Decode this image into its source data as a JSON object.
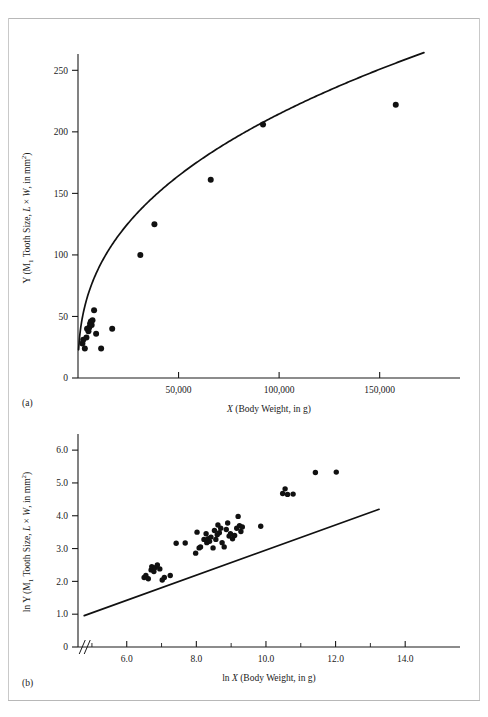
{
  "figure": {
    "panels": [
      {
        "id": "a",
        "caption": "(a)"
      },
      {
        "id": "b",
        "caption": "(b)"
      }
    ]
  },
  "chart_data": [
    {
      "type": "scatter",
      "panel": "a",
      "title": "",
      "xlabel": "X (Body Weight, in g)",
      "ylabel": "Y (M₁ Tooth Size, L × W, in mm²)",
      "ylabel_parts": {
        "prefix": "Y (M",
        "sub": "1",
        "mid": " Tooth Size, ",
        "italic_l": "L",
        "times": " × ",
        "italic_w": "W",
        "suffix": ", in mm",
        "sup": "2",
        "close": ")"
      },
      "xlabel_parts": {
        "italic_x": "X",
        "rest": " (Body Weight, in g)"
      },
      "xlim": [
        0,
        180000
      ],
      "ylim": [
        0,
        260
      ],
      "xticks": [
        0,
        50000,
        100000,
        150000
      ],
      "xticklabels": [
        "",
        "50,000",
        "100,000",
        "150,000"
      ],
      "yticks": [
        0,
        50,
        100,
        150,
        200,
        250
      ],
      "yticklabels": [
        "0",
        "50",
        "100",
        "150",
        "200",
        "250"
      ],
      "grid": false,
      "legend": "none",
      "points": [
        [
          2200,
          28
        ],
        [
          2600,
          31
        ],
        [
          3400,
          24
        ],
        [
          4200,
          33
        ],
        [
          4500,
          40
        ],
        [
          5200,
          38
        ],
        [
          5600,
          41
        ],
        [
          6000,
          44
        ],
        [
          6400,
          46
        ],
        [
          6800,
          43
        ],
        [
          7200,
          47
        ],
        [
          8000,
          55
        ],
        [
          9000,
          36
        ],
        [
          11500,
          24
        ],
        [
          17000,
          40
        ],
        [
          31000,
          100
        ],
        [
          38000,
          125
        ],
        [
          66000,
          161
        ],
        [
          92000,
          206
        ],
        [
          158000,
          222
        ]
      ],
      "fit": {
        "kind": "power",
        "label": "",
        "coefficient": 2.55,
        "exponent": 0.385,
        "x_start": 300,
        "x_end": 172000
      }
    },
    {
      "type": "scatter",
      "panel": "b",
      "title": "",
      "xlabel": "ln X (Body Weight, in g)",
      "ylabel": "ln Y (M₁ Tooth Size, L × W, in mm²)",
      "ylabel_parts": {
        "prefix": "ln Y (M",
        "sub": "1",
        "mid": " Tooth Size, ",
        "italic_l": "L",
        "times": " × ",
        "italic_w": "W",
        "suffix": ", in mm",
        "sup": "2",
        "close": ")"
      },
      "xlabel_parts": {
        "prefix": "ln ",
        "italic_x": "X",
        "rest": " (Body Weight, in g)"
      },
      "xlim": [
        4.6,
        15.0
      ],
      "ylim": [
        0,
        6.4
      ],
      "xticks": [
        5.0,
        6.0,
        7.0,
        8.0,
        9.0,
        10.0,
        11.0,
        12.0,
        13.0,
        14.0
      ],
      "xticklabels": [
        "",
        "6.0",
        "",
        "8.0",
        "",
        "10.0",
        "",
        "12.0",
        "",
        "14.0"
      ],
      "yticks": [
        0,
        1.0,
        2.0,
        3.0,
        4.0,
        5.0,
        6.0
      ],
      "yticklabels": [
        "0",
        "1.0",
        "2.0",
        "3.0",
        "4.0",
        "5.0",
        "6.0"
      ],
      "grid": false,
      "legend": "none",
      "axis_break": {
        "axis": "x",
        "symbol": "//",
        "at": 4.75
      },
      "points": [
        [
          6.5,
          2.12
        ],
        [
          6.55,
          2.18
        ],
        [
          6.62,
          2.08
        ],
        [
          6.7,
          2.35
        ],
        [
          6.72,
          2.45
        ],
        [
          6.78,
          2.3
        ],
        [
          6.82,
          2.42
        ],
        [
          6.88,
          2.5
        ],
        [
          6.95,
          2.38
        ],
        [
          7.02,
          2.04
        ],
        [
          7.08,
          2.12
        ],
        [
          7.25,
          2.18
        ],
        [
          7.42,
          3.16
        ],
        [
          7.68,
          3.17
        ],
        [
          7.98,
          2.86
        ],
        [
          8.02,
          3.5
        ],
        [
          8.08,
          3.02
        ],
        [
          8.12,
          3.05
        ],
        [
          8.22,
          3.28
        ],
        [
          8.28,
          3.45
        ],
        [
          8.3,
          3.18
        ],
        [
          8.34,
          3.3
        ],
        [
          8.38,
          3.22
        ],
        [
          8.42,
          3.35
        ],
        [
          8.48,
          3.02
        ],
        [
          8.52,
          3.55
        ],
        [
          8.56,
          3.28
        ],
        [
          8.6,
          3.42
        ],
        [
          8.62,
          3.72
        ],
        [
          8.66,
          3.48
        ],
        [
          8.7,
          3.62
        ],
        [
          8.74,
          3.18
        ],
        [
          8.8,
          3.05
        ],
        [
          8.86,
          3.58
        ],
        [
          8.9,
          3.78
        ],
        [
          8.94,
          3.38
        ],
        [
          8.98,
          3.45
        ],
        [
          9.04,
          3.3
        ],
        [
          9.1,
          3.4
        ],
        [
          9.16,
          3.62
        ],
        [
          9.2,
          3.98
        ],
        [
          9.24,
          3.7
        ],
        [
          9.28,
          3.52
        ],
        [
          9.32,
          3.66
        ],
        [
          9.85,
          3.68
        ],
        [
          10.48,
          4.68
        ],
        [
          10.55,
          4.82
        ],
        [
          10.62,
          4.65
        ],
        [
          10.78,
          4.66
        ],
        [
          11.42,
          5.32
        ],
        [
          12.02,
          5.33
        ]
      ],
      "fit": {
        "kind": "linear",
        "label": "",
        "slope": 0.3826,
        "intercept": -0.872,
        "x_start": 4.78,
        "x_end": 13.25
      }
    }
  ]
}
